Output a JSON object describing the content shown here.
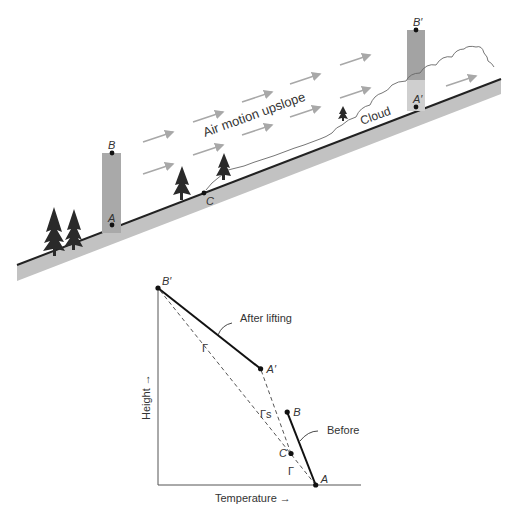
{
  "scene": {
    "air_motion_label": "Air motion upslope",
    "cloud_label": "Cloud",
    "point_labels": {
      "B": "B",
      "A": "A",
      "C": "C",
      "B_prime": "B′",
      "A_prime": "A′"
    },
    "colors": {
      "ground": "#c2c2c2",
      "ground_edge": "#222222",
      "column_before": "#a9a9a9",
      "column_after_top": "#a3a3a3",
      "column_after_bottom": "#cfcfcf",
      "arrows": "#a8a8a8",
      "trees": "#2a2a2a",
      "cloud": "#666666"
    }
  },
  "chart_data": {
    "type": "line",
    "title": "",
    "xlabel": "Temperature →",
    "ylabel": "Height →",
    "grid": false,
    "points": [
      {
        "name": "A",
        "label": "A",
        "x": 0.83,
        "y": 0.0
      },
      {
        "name": "B",
        "label": "B",
        "x": 0.68,
        "y": 0.37
      },
      {
        "name": "C",
        "label": "C",
        "x": 0.7,
        "y": 0.16
      },
      {
        "name": "A_prime",
        "label": "A′",
        "x": 0.54,
        "y": 0.59
      },
      {
        "name": "B_prime",
        "label": "B′",
        "x": 0.0,
        "y": 1.0
      }
    ],
    "series": [
      {
        "name": "Before",
        "style": "solid",
        "points": [
          "A",
          "B"
        ]
      },
      {
        "name": "After lifting",
        "style": "solid",
        "points": [
          "A_prime",
          "B_prime"
        ]
      },
      {
        "name": "Dry adiabat Γ (from A)",
        "style": "dashed",
        "points": [
          "A",
          "B_prime"
        ]
      },
      {
        "name": "Moist adiabat Γs (from C)",
        "style": "dashed",
        "points": [
          "C",
          "A_prime"
        ]
      }
    ],
    "annotations": [
      {
        "text": "After lifting",
        "target": "After lifting"
      },
      {
        "text": "Before",
        "target": "Before"
      },
      {
        "text": "Γ",
        "near": "upper dashed line"
      },
      {
        "text": "Γs",
        "near": "middle dashed line"
      },
      {
        "text": "Γ",
        "near": "lower dashed line"
      }
    ]
  }
}
